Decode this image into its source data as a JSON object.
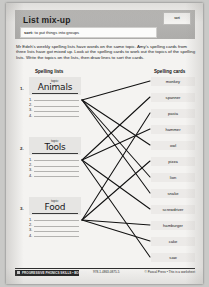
{
  "header": {
    "title": "List mix-up",
    "badge": "sort",
    "definition_term": "sort:",
    "definition_text": " to put things into groups"
  },
  "instructions": "Mr Edeh's weekly spelling lists have words on the same topic. Amy's spelling cards from three lists have got mixed up. Look at the spelling cards to work out the topics of the spelling lists. Write the topics on the lists, then draw lines to sort the cards.",
  "columns": {
    "left_heading": "Spelling lists",
    "right_heading": "Spelling cards"
  },
  "topic_label": "topic:",
  "lists": [
    {
      "number": "1.",
      "topic": "Animals",
      "rows": [
        "1.",
        "2.",
        "3.",
        "4."
      ]
    },
    {
      "number": "2.",
      "topic": "Tools",
      "rows": [
        "1.",
        "2.",
        "3.",
        "4."
      ]
    },
    {
      "number": "3.",
      "topic": "Food",
      "rows": [
        "1.",
        "2.",
        "3.",
        "4."
      ]
    }
  ],
  "cards": [
    {
      "label": "monkey"
    },
    {
      "label": "spanner"
    },
    {
      "label": "pasta"
    },
    {
      "label": "hammer"
    },
    {
      "label": "owl"
    },
    {
      "label": "pizza"
    },
    {
      "label": "lion"
    },
    {
      "label": "snake"
    },
    {
      "label": "screwdriver"
    },
    {
      "label": "hamburger"
    },
    {
      "label": "cake"
    },
    {
      "label": "saw"
    }
  ],
  "footer": {
    "book": "PROGRESSIVE PHONICS SKILLS • BOOK 3",
    "middle": "978-1-4863-0875-5",
    "right": "© Pascal Press • This is a worksheet"
  }
}
